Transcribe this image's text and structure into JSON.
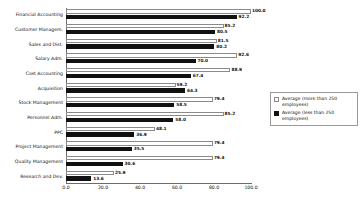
{
  "chart_data": {
    "type": "bar",
    "orientation": "horizontal",
    "title": "",
    "xlabel": "",
    "ylabel": "",
    "xlim": [
      0.0,
      100.0
    ],
    "xticks": [
      "0.0",
      "20.0",
      "40.0",
      "60.0",
      "80.0",
      "100.0"
    ],
    "xtick_values": [
      0.0,
      20.0,
      40.0,
      60.0,
      80.0,
      100.0
    ],
    "grid": false,
    "legend_position": "right",
    "categories": [
      "Financial Accounting",
      "Customer Managem.",
      "Sales and Dist.",
      "Salary Adm.",
      "Cost Accounting",
      "Acquisition",
      "Stock Management",
      "Personnel Adm.",
      "PPC",
      "Project Management",
      "Quality Management",
      "Research and Dev."
    ],
    "series": [
      {
        "name": "Average (more than 250 employees)",
        "color": "#ffffff",
        "values": [
          100.0,
          85.2,
          81.5,
          92.6,
          88.9,
          59.2,
          79.4,
          85.2,
          48.1,
          79.4,
          79.4,
          25.9
        ],
        "labels": [
          "100.0",
          "85.2",
          "81.5",
          "92.6",
          "88.9",
          "59.2",
          "79.4",
          "85.2",
          "48.1",
          "79.4",
          "79.4",
          "25.9"
        ]
      },
      {
        "name": "Average (less than 250 employees)",
        "color": "#111111",
        "values": [
          92.2,
          80.5,
          80.2,
          70.0,
          67.4,
          64.3,
          58.5,
          58.0,
          36.9,
          35.5,
          30.6,
          13.6
        ],
        "labels": [
          "92.2",
          "80.5",
          "80.2",
          "70.0",
          "67.4",
          "64.3",
          "58.5",
          "58.0",
          "36.9",
          "35.5",
          "30.6",
          "13.6"
        ]
      }
    ]
  },
  "legend": {
    "items": [
      {
        "label": "Average (more than 250 employees)",
        "swatch": "more"
      },
      {
        "label": "Average (less than 250 employees)",
        "swatch": "less"
      }
    ]
  }
}
